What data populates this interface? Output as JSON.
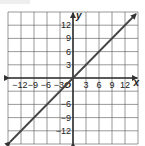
{
  "chart_data": {
    "type": "line",
    "title": "",
    "xlabel": "x",
    "ylabel": "y",
    "xlim": [
      -15,
      15
    ],
    "ylim": [
      -15,
      15
    ],
    "grid": true,
    "grid_step": 3,
    "x_ticks": [
      -12,
      -9,
      -6,
      -3,
      3,
      6,
      9,
      12
    ],
    "y_ticks": [
      12,
      9,
      6,
      3,
      -6,
      -9,
      -12
    ],
    "x_tick_labels": [
      "−12",
      "−9",
      "−6",
      "−3",
      "3",
      "6",
      "9",
      "12"
    ],
    "y_tick_labels": [
      "12",
      "9",
      "6",
      "3",
      "−6",
      "−9",
      "−12"
    ],
    "origin_label": "O",
    "series": [
      {
        "name": "y = x",
        "x": [
          -15,
          15
        ],
        "y": [
          -15,
          15
        ],
        "arrows": "both"
      }
    ]
  },
  "colors": {
    "grid": "#555555",
    "axis": "#333333",
    "line": "#444444"
  }
}
